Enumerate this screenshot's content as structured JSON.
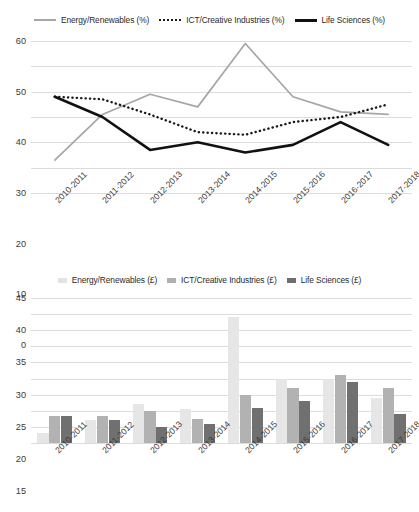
{
  "chart_data": [
    {
      "type": "line",
      "title": "",
      "xlabel": "",
      "ylabel": "",
      "ylim": [
        0,
        60
      ],
      "ytick_step": 10,
      "yticks": [
        0,
        10,
        20,
        30,
        40,
        50,
        60
      ],
      "grid": true,
      "legend_position": "top",
      "categories": [
        "2010-2011",
        "2011-2012",
        "2012-2013",
        "2013-2014",
        "2014-2015",
        "2015-2016",
        "2016-2017",
        "2017-2018"
      ],
      "series": [
        {
          "name": "Energy/Renewables (%)",
          "style": "solid-light",
          "color": "#a6a6a6",
          "values": [
            13,
            31,
            39,
            34,
            59,
            38,
            32,
            31
          ]
        },
        {
          "name": "ICT/Creative Industries (%)",
          "style": "dotted",
          "color": "#1a1a1a",
          "values": [
            38,
            37,
            31,
            24,
            23,
            28,
            30,
            35
          ]
        },
        {
          "name": "Life Sciences (%)",
          "style": "solid-dark",
          "color": "#111111",
          "values": [
            38,
            30,
            17,
            20,
            16,
            19,
            28,
            19
          ]
        }
      ]
    },
    {
      "type": "bar",
      "title": "",
      "xlabel": "",
      "ylabel": "",
      "ylim": [
        0,
        45
      ],
      "ytick_step": 5,
      "yticks": [
        0,
        5,
        10,
        15,
        20,
        25,
        30,
        35,
        40,
        45
      ],
      "grid": true,
      "legend_position": "top",
      "categories": [
        "2010-2011",
        "2011-2012",
        "2012-2013",
        "2013-2014",
        "2014-2015",
        "2015-2016",
        "2016-2017",
        "2017-2018"
      ],
      "series": [
        {
          "name": "Energy/Renewables (£)",
          "color": "#e6e6e6",
          "values": [
            3,
            7,
            12,
            10.5,
            39,
            20,
            20,
            14
          ]
        },
        {
          "name": "ICT/Creative Industries (£)",
          "color": "#b2b2b2",
          "values": [
            8.5,
            8.5,
            10,
            7.5,
            15,
            17,
            21,
            17
          ]
        },
        {
          "name": "Life Sciences (£)",
          "color": "#707070",
          "values": [
            8.5,
            7,
            5,
            6,
            11,
            13,
            19,
            9
          ]
        }
      ]
    }
  ]
}
